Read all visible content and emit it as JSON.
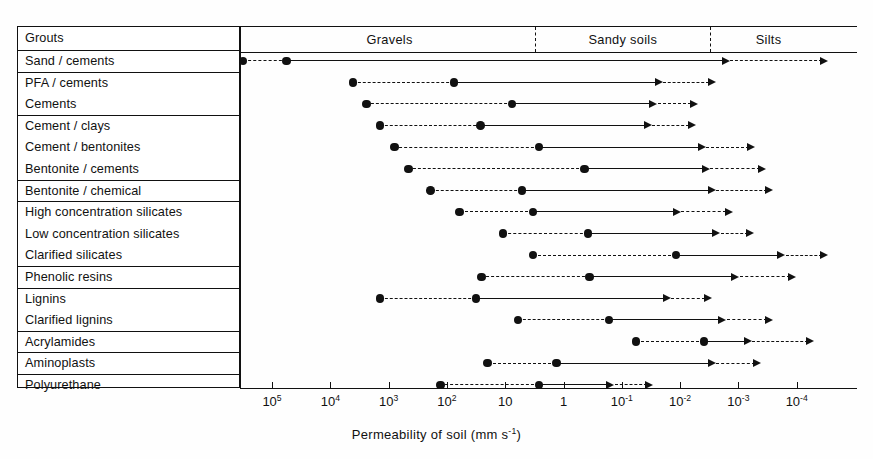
{
  "header": {
    "table_header": "Grouts",
    "soil_classes": [
      {
        "label": "Gravels",
        "start_exp": 5.5,
        "end_exp": 0.5
      },
      {
        "label": "Sandy soils",
        "start_exp": 0.5,
        "end_exp": -2.5
      },
      {
        "label": "Silts",
        "start_exp": -2.5,
        "end_exp": -4.5
      }
    ]
  },
  "axis": {
    "title_text": "Permeability of soil  (mm s",
    "title_sup": "-1",
    "title_tail": ")",
    "ticks": [
      {
        "base": "10",
        "exp": "5"
      },
      {
        "base": "10",
        "exp": "4"
      },
      {
        "base": "10",
        "exp": "3"
      },
      {
        "base": "10",
        "exp": "2"
      },
      {
        "base": "10",
        "exp": ""
      },
      {
        "base": "1",
        "exp": ""
      },
      {
        "base": "10",
        "exp": "-1"
      },
      {
        "base": "10",
        "exp": "-2"
      },
      {
        "base": "10",
        "exp": "-3"
      },
      {
        "base": "10",
        "exp": "-4"
      }
    ]
  },
  "groups": [
    {
      "rows": [
        "Sand / cements"
      ]
    },
    {
      "rows": [
        "PFA / cements",
        "Cements"
      ]
    },
    {
      "rows": [
        "Cement / clays",
        "Cement / bentonites",
        "Bentonite / cements"
      ]
    },
    {
      "rows": [
        "Bentonite / chemical"
      ]
    },
    {
      "rows": [
        "High concentration silicates",
        "Low concentration silicates",
        "Clarified silicates"
      ]
    },
    {
      "rows": [
        "Phenolic resins"
      ]
    },
    {
      "rows": [
        "Lignins",
        "Clarified lignins"
      ]
    },
    {
      "rows": [
        "Acrylamides"
      ]
    },
    {
      "rows": [
        "Aminoplasts"
      ]
    },
    {
      "rows": [
        "Polyurethane"
      ]
    }
  ],
  "chart_data": {
    "type": "bar",
    "xlabel": "Permeability of soil (mm s^-1)",
    "ylabel": "Grouts",
    "x_scale": "log10-reversed",
    "xlim_exp": [
      5.5,
      -4.55
    ],
    "grid": false,
    "legend": null,
    "annotations": [
      "Filled circles mark range limits; dashed segments indicate uncertain/marginal extent; arrowheads indicate practical limits of penetration."
    ],
    "categories": [
      "Sand / cements",
      "PFA / cements",
      "Cements",
      "Cement / clays",
      "Cement / bentonites",
      "Bentonite / cements",
      "Bentonite / chemical",
      "High concentration silicates",
      "Low concentration silicates",
      "Clarified silicates",
      "Phenolic resins",
      "Lignins",
      "Clarified lignins",
      "Acrylamides",
      "Aminoplasts",
      "Polyurethane"
    ],
    "series": [
      {
        "name": "outer_start_exp",
        "values": [
          5.5,
          3.61,
          3.38,
          3.15,
          2.9,
          2.66,
          2.28,
          1.78,
          1.04,
          0.52,
          1.41,
          3.15,
          0.78,
          -1.24,
          1.3,
          2.11
        ]
      },
      {
        "name": "inner_start_exp",
        "values": [
          4.75,
          1.88,
          0.88,
          1.42,
          0.42,
          -0.36,
          0.71,
          0.52,
          -0.42,
          -1.93,
          -0.45,
          1.5,
          -0.78,
          -2.41,
          0.12,
          0.42
        ]
      },
      {
        "name": "solid_end_exp",
        "values": [
          -2.86,
          -1.71,
          -1.62,
          -1.52,
          -2.45,
          -2.52,
          -2.62,
          -2.02,
          -2.7,
          -3.81,
          -3.02,
          -1.85,
          -2.8,
          -3.24,
          -2.62,
          -0.88
        ]
      },
      {
        "name": "dashed_end_exp",
        "values": [
          -4.55,
          -2.62,
          -2.31,
          -2.28,
          -3.3,
          -3.49,
          -3.61,
          -2.91,
          -3.28,
          -4.55,
          -4.0,
          -2.55,
          -3.61,
          -4.31,
          -3.4,
          -1.55
        ]
      }
    ],
    "units": "mm s^-1"
  }
}
